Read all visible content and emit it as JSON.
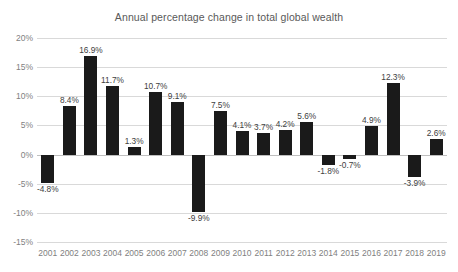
{
  "chart_data": {
    "type": "bar",
    "title": "Annual percentage change in total global wealth",
    "xlabel": "",
    "ylabel": "",
    "ylim": [
      -15,
      20
    ],
    "grid": true,
    "legend": "none",
    "value_suffix": "%",
    "categories": [
      "2001",
      "2002",
      "2003",
      "2004",
      "2005",
      "2006",
      "2007",
      "2008",
      "2009",
      "2010",
      "2011",
      "2012",
      "2013",
      "2014",
      "2015",
      "2016",
      "2017",
      "2018",
      "2019"
    ],
    "values": [
      -4.8,
      8.4,
      16.9,
      11.7,
      1.3,
      10.7,
      9.1,
      -9.9,
      7.5,
      4.1,
      3.7,
      4.2,
      5.6,
      -1.8,
      -0.7,
      4.9,
      12.3,
      -3.9,
      2.6
    ],
    "data_labels": [
      "-4.8%",
      "8.4%",
      "16.9%",
      "11.7%",
      "1.3%",
      "10.7%",
      "9.1%",
      "-9.9%",
      "7.5%",
      "4.1%",
      "3.7%",
      "4.2%",
      "5.6%",
      "-1.8%",
      "-0.7%",
      "4.9%",
      "12.3%",
      "-3.9%",
      "2.6%"
    ],
    "yticks": [
      20,
      15,
      10,
      5,
      0,
      -5,
      -10,
      -15
    ],
    "ytick_labels": [
      "20%",
      "15%",
      "10%",
      "5%",
      "0%",
      "-5%",
      "-10%",
      "-15%"
    ],
    "colors": {
      "bar": "#1a1a1a",
      "grid": "#d9d9d9",
      "zero_line": "#bfbfbf",
      "title_text": "#595959",
      "tick_text": "#7f7f7f",
      "label_text": "#404040",
      "background": "#ffffff"
    }
  }
}
